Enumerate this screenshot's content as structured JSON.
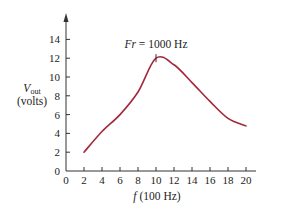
{
  "chart_data": {
    "type": "line",
    "title": "",
    "xlabel_italic": "f",
    "xlabel_rest": " (100 Hz)",
    "ylabel_main": "V",
    "ylabel_sub": "out",
    "ylabel_unit": "(volts)",
    "xlim": [
      0,
      20
    ],
    "ylim": [
      0,
      14
    ],
    "x_ticks": [
      0,
      2,
      4,
      6,
      8,
      10,
      12,
      14,
      16,
      18,
      20
    ],
    "y_ticks": [
      0,
      2,
      4,
      6,
      8,
      10,
      12,
      14
    ],
    "grid": false,
    "series": [
      {
        "name": "Vout",
        "color": "#a3283c",
        "x": [
          2,
          4,
          6,
          8,
          10,
          12,
          14,
          16,
          18,
          20
        ],
        "y": [
          2.0,
          4.2,
          6.0,
          8.4,
          12.0,
          11.3,
          9.4,
          7.4,
          5.6,
          4.8
        ]
      }
    ],
    "annotations": [
      {
        "text_italic": "Fr",
        "text_rest": " = 1000 Hz",
        "x": 10,
        "y": 12,
        "marker": "tick"
      }
    ]
  }
}
